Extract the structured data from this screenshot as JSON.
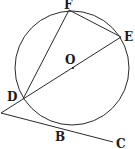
{
  "diagram": {
    "type": "geometry",
    "circle": {
      "center_label": "O",
      "cx": 72,
      "cy": 68,
      "r": 57
    },
    "points": {
      "F": {
        "label": "F",
        "x": 69,
        "y": 10
      },
      "E": {
        "label": "E",
        "x": 121,
        "y": 37
      },
      "O": {
        "label": "O",
        "x": 73,
        "y": 68
      },
      "D": {
        "label": "D",
        "x": 23,
        "y": 99
      },
      "B": {
        "label": "B",
        "x": 58,
        "y": 127
      },
      "C": {
        "label": "C",
        "x": 113,
        "y": 142
      },
      "P": {
        "label": "",
        "x": 1,
        "y": 113
      }
    },
    "segments": [
      [
        "F",
        "D"
      ],
      [
        "F",
        "E"
      ],
      [
        "E",
        "P"
      ],
      [
        "P",
        "C"
      ]
    ],
    "colors": {
      "stroke": "#2a2a2a",
      "background": "#ffffff"
    }
  }
}
